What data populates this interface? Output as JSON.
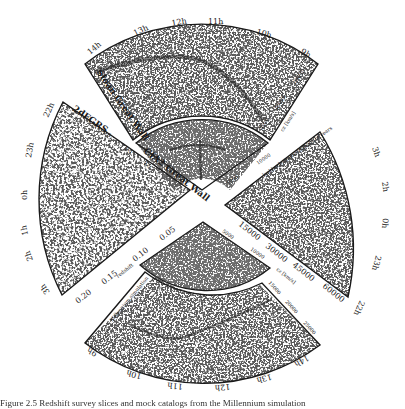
{
  "figure": {
    "caption_partial": "Figure 2.5  Redshift survey slices and mock catalogs from the Millennium simulation",
    "colors": {
      "ink": "#1a1a1a",
      "galaxy": "#222222",
      "background": "#ffffff"
    }
  },
  "panels": {
    "top_outer": {
      "name": "Sloan Great Wall",
      "ra_ticks": [
        "14h",
        "13h",
        "12h",
        "11h",
        "10h",
        "9h"
      ],
      "cz_label": "cz [km/s]",
      "cz_ticks": [
        "5000",
        "20000",
        "25000"
      ]
    },
    "top_inner": {
      "name": "CfA2 Great Wall",
      "ra_ticks": [
        "17h",
        "16h",
        "15h",
        "14h",
        "13h",
        "12h",
        "11h",
        "10h",
        "9h",
        "8h"
      ],
      "cz_ticks": [
        "5000",
        "10000"
      ],
      "side_label": "lookback time in billions of years",
      "side_ticks": [
        "0.5"
      ]
    },
    "left": {
      "name": "2dFGRS",
      "ra_ticks": [
        "22h",
        "23h",
        "0h",
        "1h",
        "2h",
        "3h"
      ],
      "z_label": "redshift",
      "z_ticks": [
        "0.5",
        "1.0",
        "1.5",
        "0.05",
        "0.10",
        "0.15",
        "0.20"
      ]
    },
    "right": {
      "name": "Millennium simulation",
      "ra_ticks": [
        "3h",
        "2h",
        "1h",
        "0h",
        "23h",
        "22h"
      ],
      "cz_label": "cz [km/s]",
      "cz_ticks": [
        "15000",
        "30000",
        "45000",
        "60000"
      ]
    },
    "bottom_inner": {
      "name": "Millennium simulation",
      "ra_ticks": [
        "9h",
        "10h",
        "11h",
        "12h",
        "13h",
        "14h"
      ],
      "cz_label": "cz [km/s]",
      "cz_ticks": [
        "5000",
        "10000"
      ]
    },
    "bottom_outer": {
      "name": "Millennium simulation",
      "ra_ticks": [
        "9h",
        "10h",
        "11h",
        "12h",
        "13h",
        "14h"
      ],
      "cz_ticks": [
        "15000",
        "20000",
        "25000"
      ]
    }
  }
}
